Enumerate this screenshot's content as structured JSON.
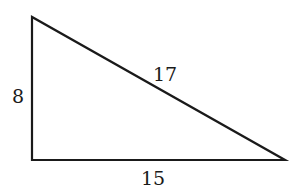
{
  "diagram": {
    "type": "right-triangle",
    "stroke_color": "#1a1a1a",
    "vertices": {
      "top": [
        32,
        17
      ],
      "bottom_left": [
        32,
        160
      ],
      "bottom_right": [
        285,
        160
      ]
    },
    "labels": {
      "vertical_leg": "8",
      "hypotenuse": "17",
      "horizontal_leg": "15"
    }
  }
}
